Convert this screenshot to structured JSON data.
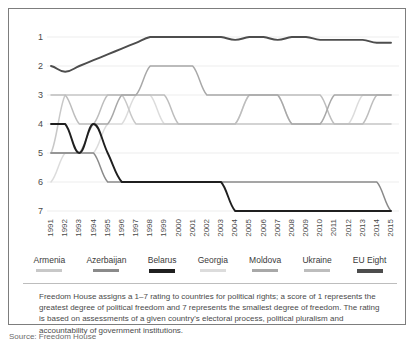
{
  "top_fragment": "",
  "chart_data": {
    "type": "line",
    "title": "",
    "xlabel": "",
    "ylabel": "",
    "ylim": [
      1,
      7
    ],
    "y_inverted": true,
    "y_ticks": [
      1,
      2,
      3,
      4,
      5,
      6,
      7
    ],
    "grid": true,
    "legend_position": "bottom",
    "x": [
      1991,
      1992,
      1993,
      1994,
      1995,
      1996,
      1997,
      1998,
      1999,
      2000,
      2001,
      2002,
      2003,
      2004,
      2005,
      2006,
      2007,
      2008,
      2009,
      2010,
      2011,
      2012,
      2013,
      2014,
      2015
    ],
    "categories": [
      "1991",
      "1992",
      "1993",
      "1994",
      "1995",
      "1996",
      "1997",
      "1998",
      "1999",
      "2000",
      "2001",
      "2002",
      "2003",
      "2004",
      "2005",
      "2006",
      "2007",
      "2008",
      "2009",
      "2010",
      "2011",
      "2012",
      "2013",
      "2014",
      "2015"
    ],
    "series": [
      {
        "name": "Armenia",
        "color": "#c8c8c8",
        "values": [
          5,
          3,
          3,
          3,
          3,
          3,
          4,
          4,
          4,
          4,
          4,
          4,
          4,
          4,
          4,
          4,
          4,
          4,
          4,
          4,
          4,
          4,
          4,
          4,
          4
        ]
      },
      {
        "name": "Azerbaijan",
        "color": "#8a8a8a",
        "values": [
          5,
          5,
          5,
          5,
          6,
          6,
          6,
          6,
          6,
          6,
          6,
          6,
          6,
          6,
          6,
          6,
          6,
          6,
          6,
          6,
          6,
          6,
          6,
          6,
          7
        ]
      },
      {
        "name": "Belarus",
        "color": "#1f1f1f",
        "values": [
          4,
          4,
          5,
          4,
          5,
          6,
          6,
          6,
          6,
          6,
          6,
          6,
          6,
          7,
          7,
          7,
          7,
          7,
          7,
          7,
          7,
          7,
          7,
          7,
          7
        ]
      },
      {
        "name": "Georgia",
        "color": "#dcdcdc",
        "values": [
          6,
          5,
          5,
          5,
          4,
          4,
          3,
          3,
          4,
          4,
          4,
          4,
          4,
          4,
          3,
          3,
          3,
          4,
          4,
          4,
          4,
          4,
          3,
          3,
          3
        ]
      },
      {
        "name": "Moldova",
        "color": "#a8a8a8",
        "values": [
          5,
          5,
          5,
          4,
          4,
          3,
          3,
          2,
          2,
          2,
          2,
          3,
          3,
          3,
          3,
          3,
          3,
          4,
          4,
          4,
          3,
          3,
          3,
          3,
          3
        ]
      },
      {
        "name": "Ukraine",
        "color": "#bdbdbd",
        "values": [
          3,
          3,
          4,
          4,
          3,
          3,
          3,
          3,
          3,
          4,
          4,
          4,
          4,
          4,
          3,
          3,
          3,
          3,
          3,
          3,
          4,
          4,
          4,
          3,
          3
        ]
      },
      {
        "name": "EU Eight",
        "color": "#4d4d4d",
        "values": [
          2,
          2.2,
          2,
          1.8,
          1.6,
          1.4,
          1.2,
          1,
          1,
          1,
          1,
          1,
          1,
          1.1,
          1,
          1,
          1.1,
          1,
          1,
          1.1,
          1.1,
          1.1,
          1.1,
          1.2,
          1.2
        ]
      }
    ]
  },
  "legend": {
    "items": [
      {
        "label": "Armenia",
        "color": "#c8c8c8"
      },
      {
        "label": "Azerbaijan",
        "color": "#8a8a8a"
      },
      {
        "label": "Belarus",
        "color": "#1f1f1f"
      },
      {
        "label": "Georgia",
        "color": "#dcdcdc"
      },
      {
        "label": "Moldova",
        "color": "#a8a8a8"
      },
      {
        "label": "Ukraine",
        "color": "#bdbdbd"
      },
      {
        "label": "EU Eight",
        "color": "#4d4d4d"
      }
    ]
  },
  "caption": {
    "text": "Freedom House assigns a 1–7 rating to countries for political rights; a score of 1 represents the greatest degree of political freedom and 7 represents the smallest degree of freedom. The rating is based on assessments of a given country's electoral process, political pluralism and accountability of government institutions."
  },
  "source": {
    "text": "Source: Freedom House"
  }
}
